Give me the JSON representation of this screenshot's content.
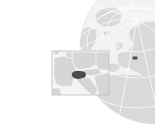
{
  "map": {
    "type": "locator-map",
    "highlighted_region": "Switzerland",
    "colors": {
      "background": "#ffffff",
      "ocean": "#f2f2f2",
      "land": "#d9d9d9",
      "borders": "#ffffff",
      "graticule": "#ffffff",
      "highlight": "#4d4d4d",
      "inset_frame": "#bdbdbd",
      "inset_land": "#d6d6d6",
      "inset_sea": "#f4f4f4"
    },
    "globe": {
      "center_x": 156,
      "center_y": 48,
      "radius": 76,
      "highlight_x": 135,
      "highlight_y": 58
    },
    "inset": {
      "x": 52,
      "y": 51,
      "width": 57,
      "height": 44,
      "highlight_x": 78,
      "highlight_y": 75
    }
  }
}
